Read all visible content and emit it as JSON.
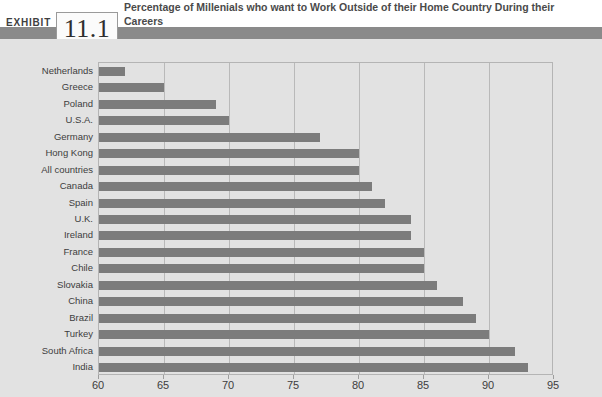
{
  "exhibit": {
    "label": "EXHIBIT",
    "number": "11.1",
    "title": "Percentage of Millenials who want to Work Outside of their Home Country During their Careers"
  },
  "colors": {
    "band": "#8a8a8a",
    "bar": "#7c7c7c",
    "plot_background": "#e2e2e2",
    "gridline": "#b9b9b9",
    "frame": "#b4b4b4"
  },
  "chart_data": {
    "type": "bar",
    "orientation": "horizontal",
    "title": "Percentage of Millenials who want to Work Outside of their Home Country During their Careers",
    "xlabel": "",
    "ylabel": "",
    "xlim": [
      60,
      95
    ],
    "xticks": [
      60,
      65,
      70,
      75,
      80,
      85,
      90,
      95
    ],
    "grid": true,
    "legend": false,
    "categories": [
      "Netherlands",
      "Greece",
      "Poland",
      "U.S.A.",
      "Germany",
      "Hong Kong",
      "All countries",
      "Canada",
      "Spain",
      "U.K.",
      "Ireland",
      "France",
      "Chile",
      "Slovakia",
      "China",
      "Brazil",
      "Turkey",
      "South Africa",
      "India"
    ],
    "values": [
      62,
      65,
      69,
      70,
      77,
      80,
      80,
      81,
      82,
      84,
      84,
      85,
      85,
      86,
      88,
      89,
      90,
      92,
      93
    ]
  }
}
